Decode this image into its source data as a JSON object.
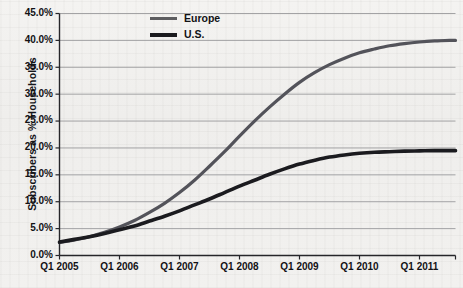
{
  "chart_data": {
    "type": "line",
    "title": "",
    "subtitle": "",
    "xlabel": "",
    "ylabel": "Subscribers as % Households",
    "x_tick_labels": [
      "Q1 2005",
      "Q1 2006",
      "Q1 2007",
      "Q1 2008",
      "Q1 2009",
      "Q1 2010",
      "Q1 2011"
    ],
    "y_tick_labels": [
      "0.0%",
      "5.0%",
      "10.0%",
      "15.0%",
      "20.0%",
      "25.0%",
      "30.0%",
      "35.0%",
      "40.0%",
      "45.0%"
    ],
    "ylim": [
      0,
      45
    ],
    "xlim": [
      2005,
      2011.6
    ],
    "grid": true,
    "grid_axis": "y",
    "legend_position": "top-center",
    "legend": [
      "Europe",
      "U.S."
    ],
    "x": [
      2005.0,
      2005.25,
      2005.5,
      2005.75,
      2006.0,
      2006.25,
      2006.5,
      2006.75,
      2007.0,
      2007.25,
      2007.5,
      2007.75,
      2008.0,
      2008.25,
      2008.5,
      2008.75,
      2009.0,
      2009.25,
      2009.5,
      2009.75,
      2010.0,
      2010.25,
      2010.5,
      2010.75,
      2011.0,
      2011.25,
      2011.5,
      2011.6
    ],
    "series": [
      {
        "name": "Europe",
        "color": "#53535a",
        "line_width": 3.2,
        "values": [
          2.4,
          2.9,
          3.5,
          4.3,
          5.3,
          6.5,
          8.0,
          9.7,
          11.7,
          14.0,
          16.6,
          19.3,
          22.2,
          25.0,
          27.6,
          30.0,
          32.2,
          34.0,
          35.5,
          36.7,
          37.7,
          38.4,
          39.0,
          39.4,
          39.7,
          39.9,
          40.0,
          40.0
        ]
      },
      {
        "name": "U.S.",
        "color": "#1b1b1f",
        "line_width": 3.6,
        "values": [
          2.5,
          3.0,
          3.5,
          4.1,
          4.8,
          5.5,
          6.4,
          7.3,
          8.3,
          9.4,
          10.5,
          11.7,
          12.9,
          14.0,
          15.1,
          16.1,
          17.0,
          17.7,
          18.3,
          18.7,
          19.0,
          19.2,
          19.3,
          19.4,
          19.45,
          19.5,
          19.5,
          19.5
        ]
      }
    ],
    "axis_color": "#26262a",
    "grid_color": "#9a9a9c",
    "background_color": "#f1f0ee"
  }
}
